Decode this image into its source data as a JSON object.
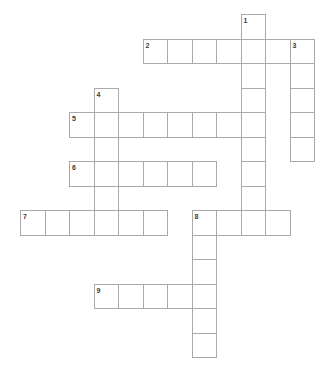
{
  "puzzle": {
    "kind": "crossword-grid",
    "title": "Crossword Puzzle Grid",
    "background_color": "#ffffff",
    "cell_border_color": "#a9a9a9",
    "cell_fill_color": "#ffffff",
    "number_color": "#3a3a3a",
    "cell_size_px": 24.5,
    "origin_x_px": 20,
    "origin_y_px": 14,
    "columns": 13,
    "rows": 15,
    "total_entries": 9,
    "total_cells": 52,
    "entries": [
      {
        "number": "1",
        "direction": "down",
        "start_col": 9,
        "start_row": 0,
        "length": 9,
        "answer": ""
      },
      {
        "number": "2",
        "direction": "across",
        "start_col": 5,
        "start_row": 1,
        "length": 7,
        "answer": ""
      },
      {
        "number": "3",
        "direction": "down",
        "start_col": 11,
        "start_row": 1,
        "length": 5,
        "answer": ""
      },
      {
        "number": "4",
        "direction": "down",
        "start_col": 3,
        "start_row": 3,
        "length": 6,
        "answer": ""
      },
      {
        "number": "5",
        "direction": "across",
        "start_col": 2,
        "start_row": 4,
        "length": 8,
        "answer": ""
      },
      {
        "number": "6",
        "direction": "across",
        "start_col": 2,
        "start_row": 6,
        "length": 6,
        "answer": ""
      },
      {
        "number": "7",
        "direction": "across",
        "start_col": 0,
        "start_row": 8,
        "length": 6,
        "answer": ""
      },
      {
        "number": "8",
        "direction": "across",
        "start_col": 7,
        "start_row": 8,
        "length": 4,
        "answer": ""
      },
      {
        "number": "8",
        "direction": "down",
        "start_col": 7,
        "start_row": 8,
        "length": 6,
        "answer": ""
      },
      {
        "number": "9",
        "direction": "across",
        "start_col": 3,
        "start_row": 11,
        "length": 5,
        "answer": ""
      }
    ],
    "cells": [
      {
        "col": 9,
        "row": 0,
        "number": "1"
      },
      {
        "col": 5,
        "row": 1,
        "number": "2"
      },
      {
        "col": 6,
        "row": 1,
        "number": ""
      },
      {
        "col": 7,
        "row": 1,
        "number": ""
      },
      {
        "col": 8,
        "row": 1,
        "number": ""
      },
      {
        "col": 9,
        "row": 1,
        "number": ""
      },
      {
        "col": 10,
        "row": 1,
        "number": ""
      },
      {
        "col": 11,
        "row": 1,
        "number": "3"
      },
      {
        "col": 9,
        "row": 2,
        "number": ""
      },
      {
        "col": 11,
        "row": 2,
        "number": ""
      },
      {
        "col": 9,
        "row": 3,
        "number": ""
      },
      {
        "col": 11,
        "row": 3,
        "number": ""
      },
      {
        "col": 3,
        "row": 3,
        "number": "4"
      },
      {
        "col": 2,
        "row": 4,
        "number": "5"
      },
      {
        "col": 3,
        "row": 4,
        "number": ""
      },
      {
        "col": 4,
        "row": 4,
        "number": ""
      },
      {
        "col": 5,
        "row": 4,
        "number": ""
      },
      {
        "col": 6,
        "row": 4,
        "number": ""
      },
      {
        "col": 7,
        "row": 4,
        "number": ""
      },
      {
        "col": 8,
        "row": 4,
        "number": ""
      },
      {
        "col": 9,
        "row": 4,
        "number": ""
      },
      {
        "col": 11,
        "row": 4,
        "number": ""
      },
      {
        "col": 9,
        "row": 5,
        "number": ""
      },
      {
        "col": 11,
        "row": 5,
        "number": ""
      },
      {
        "col": 3,
        "row": 5,
        "number": ""
      },
      {
        "col": 2,
        "row": 6,
        "number": "6"
      },
      {
        "col": 3,
        "row": 6,
        "number": ""
      },
      {
        "col": 4,
        "row": 6,
        "number": ""
      },
      {
        "col": 5,
        "row": 6,
        "number": ""
      },
      {
        "col": 6,
        "row": 6,
        "number": ""
      },
      {
        "col": 7,
        "row": 6,
        "number": ""
      },
      {
        "col": 9,
        "row": 6,
        "number": ""
      },
      {
        "col": 3,
        "row": 7,
        "number": ""
      },
      {
        "col": 9,
        "row": 7,
        "number": ""
      },
      {
        "col": 0,
        "row": 8,
        "number": "7"
      },
      {
        "col": 1,
        "row": 8,
        "number": ""
      },
      {
        "col": 2,
        "row": 8,
        "number": ""
      },
      {
        "col": 3,
        "row": 8,
        "number": ""
      },
      {
        "col": 4,
        "row": 8,
        "number": ""
      },
      {
        "col": 5,
        "row": 8,
        "number": ""
      },
      {
        "col": 7,
        "row": 8,
        "number": "8"
      },
      {
        "col": 8,
        "row": 8,
        "number": ""
      },
      {
        "col": 9,
        "row": 8,
        "number": ""
      },
      {
        "col": 10,
        "row": 8,
        "number": ""
      },
      {
        "col": 7,
        "row": 9,
        "number": ""
      },
      {
        "col": 7,
        "row": 10,
        "number": ""
      },
      {
        "col": 3,
        "row": 11,
        "number": "9"
      },
      {
        "col": 4,
        "row": 11,
        "number": ""
      },
      {
        "col": 5,
        "row": 11,
        "number": ""
      },
      {
        "col": 6,
        "row": 11,
        "number": ""
      },
      {
        "col": 7,
        "row": 11,
        "number": ""
      },
      {
        "col": 7,
        "row": 12,
        "number": ""
      },
      {
        "col": 7,
        "row": 13,
        "number": ""
      }
    ]
  }
}
